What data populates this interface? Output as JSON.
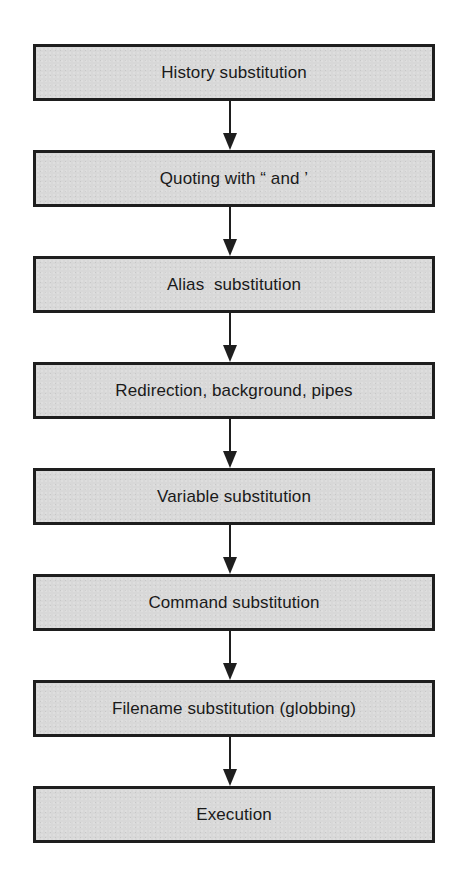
{
  "diagram": {
    "type": "flowchart",
    "direction": "top-to-bottom",
    "colors": {
      "box_fill": "#d8d8d8",
      "box_border": "#1e1e1e",
      "arrow": "#1e1e1e",
      "text": "#1a1a1a",
      "background": "#ffffff"
    },
    "steps": [
      {
        "label": "History substitution"
      },
      {
        "label": "Quoting with “ and ’"
      },
      {
        "label": "Alias  substitution"
      },
      {
        "label": "Redirection, background, pipes"
      },
      {
        "label": "Variable substitution"
      },
      {
        "label": "Command substitution"
      },
      {
        "label": "Filename substitution (globbing)"
      },
      {
        "label": "Execution"
      }
    ],
    "edges": [
      {
        "from": 0,
        "to": 1
      },
      {
        "from": 1,
        "to": 2
      },
      {
        "from": 2,
        "to": 3
      },
      {
        "from": 3,
        "to": 4
      },
      {
        "from": 4,
        "to": 5
      },
      {
        "from": 5,
        "to": 6
      },
      {
        "from": 6,
        "to": 7
      }
    ]
  }
}
